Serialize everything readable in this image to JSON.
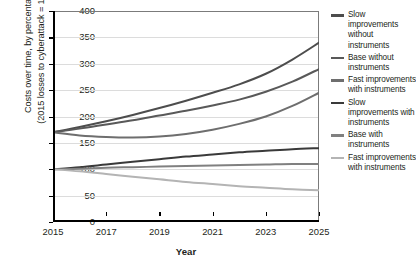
{
  "chart_data": {
    "type": "line",
    "title": "",
    "xlabel": "Year",
    "ylabel": "Costs over time, by percentage (2015 losses to cyberattack = 100%)",
    "ylabel_line1": "Costs over time, by percentage",
    "ylabel_line2": "(2015 losses to cyberattack = 100%)",
    "ylim": [
      0,
      400
    ],
    "xlim": [
      2015,
      2025
    ],
    "ytick_values": [
      0,
      50,
      100,
      150,
      200,
      250,
      300,
      350,
      400
    ],
    "ytick_labels": [
      "0",
      "50",
      "100",
      "150",
      "200",
      "250",
      "300",
      "350",
      "400"
    ],
    "xtick_values": [
      2015,
      2017,
      2019,
      2021,
      2023,
      2025
    ],
    "xtick_labels": [
      "2015",
      "2017",
      "2019",
      "2021",
      "2023",
      "2025"
    ],
    "grid": true,
    "grid_axis": "y",
    "legend_position": "right",
    "x": [
      2015,
      2016,
      2017,
      2018,
      2019,
      2020,
      2021,
      2022,
      2023,
      2024,
      2025
    ],
    "series": [
      {
        "name": "Slow improvements without instruments",
        "color": "#4d4d4d",
        "values": [
          170,
          180,
          191,
          203,
          216,
          230,
          245,
          261,
          281,
          308,
          340
        ]
      },
      {
        "name": "Base without instruments",
        "color": "#595959",
        "values": [
          170,
          177,
          185,
          193,
          202,
          211,
          221,
          232,
          247,
          266,
          290
        ]
      },
      {
        "name": "Fast improvements with instruments",
        "color": "#6e6e6e",
        "values": [
          170,
          164,
          161,
          160,
          162,
          167,
          175,
          186,
          200,
          220,
          245
        ]
      },
      {
        "name": "Slow improvements with instruments",
        "color": "#3a3a3a",
        "values": [
          100,
          104,
          109,
          114,
          119,
          124,
          128,
          132,
          135,
          138,
          140
        ]
      },
      {
        "name": "Base with instruments",
        "color": "#808080",
        "values": [
          100,
          101,
          103,
          104,
          105,
          106,
          107,
          108,
          109,
          110,
          110
        ]
      },
      {
        "name": "Fast improvements with instruments",
        "color": "#b4b4b4",
        "values": [
          100,
          96,
          91,
          86,
          81,
          76,
          72,
          68,
          65,
          62,
          60
        ]
      }
    ]
  },
  "legend": {
    "items": [
      {
        "label": "Slow improvements without instruments",
        "color": "#4d4d4d"
      },
      {
        "label": "Base without instruments",
        "color": "#595959"
      },
      {
        "label": "Fast improvements with instruments",
        "color": "#6e6e6e"
      },
      {
        "label": "Slow improvements with instruments",
        "color": "#3a3a3a"
      },
      {
        "label": "Base with instruments",
        "color": "#808080"
      },
      {
        "label": "Fast improvements with instruments",
        "color": "#b4b4b4"
      }
    ]
  }
}
